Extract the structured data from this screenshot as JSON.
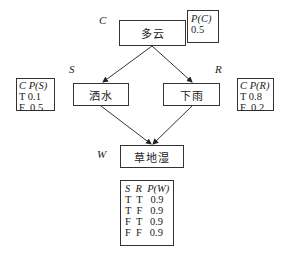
{
  "nodes": {
    "cloudy": {
      "label": "多云",
      "var": "C"
    },
    "sprinkler": {
      "label": "洒水",
      "var": "S"
    },
    "rain": {
      "label": "下雨",
      "var": "R"
    },
    "wetgrass": {
      "label": "草地湿",
      "var": "W"
    }
  },
  "cpt": {
    "c": {
      "header": "P(C)",
      "rows": [
        "0.5"
      ]
    },
    "s": {
      "header": "C P(S)",
      "rows": [
        "T 0.1",
        "F  0.5"
      ]
    },
    "r": {
      "header": "C P(R)",
      "rows": [
        "T 0.8",
        "F  0.2"
      ]
    },
    "w": {
      "header": "S  R  P(W)",
      "rows": [
        "T  T   0.9",
        "T  F   0.9",
        "F  T   0.9",
        "F  F   0.9"
      ]
    }
  },
  "edges": [
    {
      "from": "C",
      "to": "S"
    },
    {
      "from": "C",
      "to": "R"
    },
    {
      "from": "S",
      "to": "W"
    },
    {
      "from": "R",
      "to": "W"
    }
  ]
}
